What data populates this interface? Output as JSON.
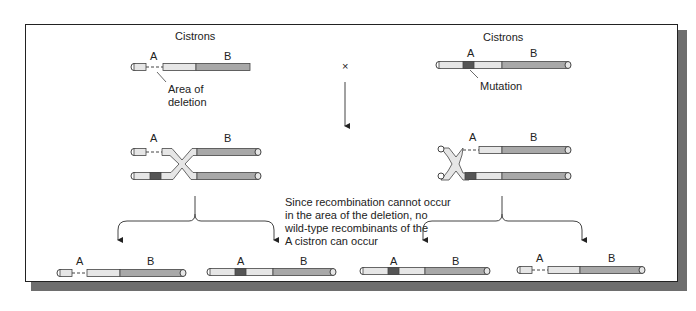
{
  "labels": {
    "cistrons_left": "Cistrons",
    "cistrons_right": "Cistrons",
    "cistron_a": "A",
    "cistron_b": "B",
    "area_of_deletion_line1": "Area of",
    "area_of_deletion_line2": "deletion",
    "mutation": "Mutation",
    "cross_symbol": "×",
    "explanation": [
      "Since recombination cannot occur",
      "in the area of the deletion, no",
      "wild-type recombinants of the",
      "A cistron can occur"
    ]
  },
  "colors": {
    "cistron_a_fill": "#e6e6e6",
    "cistron_b_fill": "#a8a8a8",
    "mutation_fill": "#555555",
    "outline": "#444444",
    "frame_shadow": "#6e6e6e"
  }
}
